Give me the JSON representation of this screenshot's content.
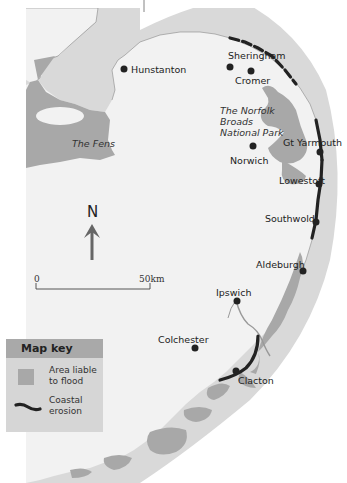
{
  "map": {
    "title": "Norfolk and Suffolk coast: flood risk and coastal erosion",
    "places": [
      {
        "name": "Hunstanton",
        "type": "town"
      },
      {
        "name": "Sheringham",
        "type": "town"
      },
      {
        "name": "Cromer",
        "type": "town"
      },
      {
        "name": "Norwich",
        "type": "city"
      },
      {
        "name": "Gt Yarmouth",
        "type": "town"
      },
      {
        "name": "Lowestoft",
        "type": "town"
      },
      {
        "name": "Southwold",
        "type": "town"
      },
      {
        "name": "Aldeburgh",
        "type": "town"
      },
      {
        "name": "Ipswich",
        "type": "town"
      },
      {
        "name": "Colchester",
        "type": "town"
      },
      {
        "name": "Clacton",
        "type": "town"
      }
    ],
    "regions": {
      "fens": "The Fens",
      "broads_line1": "The Norfolk",
      "broads_line2": "Broads",
      "broads_line3": "National Park"
    },
    "north_arrow": {
      "label": "N",
      "icon": "north-arrow-icon"
    },
    "scale_bar": {
      "start": "0",
      "end": "50km"
    },
    "colors": {
      "sea": "#d9d9d9",
      "land": "#f2f2f2",
      "flood_area": "#a8a8a8",
      "erosion": "#222222"
    }
  },
  "key": {
    "title": "Map key",
    "items": [
      {
        "label_line1": "Area liable",
        "label_line2": "to flood",
        "icon": "flood-area-swatch"
      },
      {
        "label_line1": "Coastal",
        "label_line2": "erosion",
        "icon": "coastal-erosion-line-icon"
      }
    ]
  }
}
